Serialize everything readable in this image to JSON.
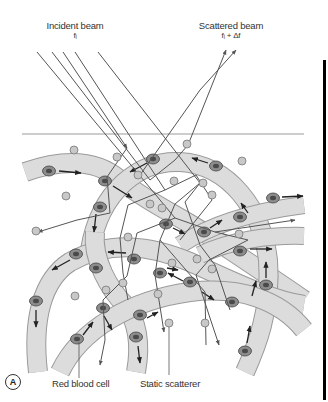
{
  "figure": {
    "panel_label": "A",
    "labels": {
      "incident_beam": "Incident beam",
      "incident_freq": "fᵢ",
      "scattered_beam": "Scattered beam",
      "scattered_freq": "fᵢ + Δf",
      "red_blood_cell": "Red blood cell",
      "static_scatterer": "Static scatterer"
    },
    "colors": {
      "vessel_fill": "#d9d9d9",
      "vessel_edge": "#9a9a9a",
      "cell_fill": "#8c8c8c",
      "cell_core": "#4a4a4a",
      "scatterer_fill": "#c8c8c8",
      "beam_line": "#555555",
      "surface_line": "#bdbdbd",
      "right_bar": "#000000"
    }
  }
}
